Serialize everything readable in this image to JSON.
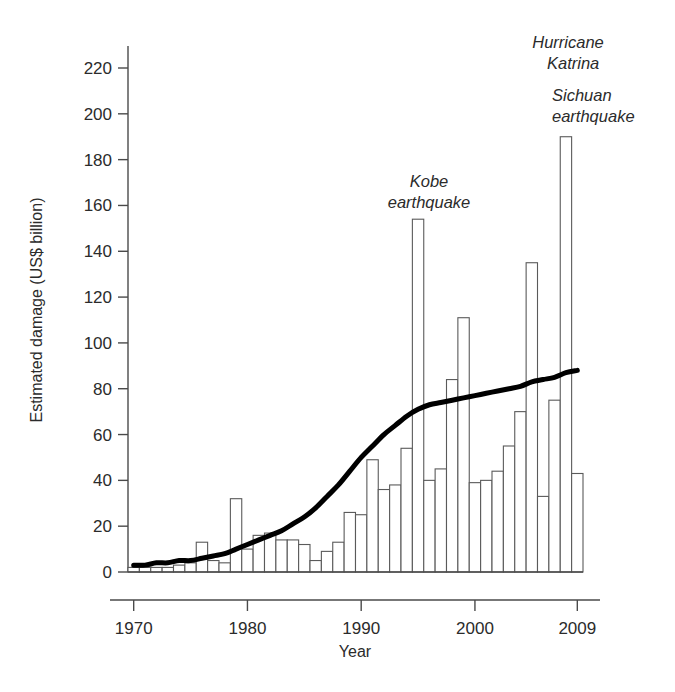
{
  "chart_data": {
    "type": "bar",
    "title": "",
    "xlabel": "Year",
    "ylabel": "Estimated damage (US$ billion)",
    "xlim": [
      1969.5,
      2009.5
    ],
    "ylim": [
      0,
      230
    ],
    "grid": false,
    "legend": "none",
    "x_tick_labels": [
      "1970",
      "1980",
      "1990",
      "2000",
      "2009"
    ],
    "x_tick_values": [
      1970,
      1980,
      1990,
      2000,
      2009
    ],
    "y_tick_labels": [
      "0",
      "20",
      "40",
      "60",
      "80",
      "100",
      "120",
      "140",
      "160",
      "180",
      "200",
      "220"
    ],
    "y_tick_values": [
      0,
      20,
      40,
      60,
      80,
      100,
      120,
      140,
      160,
      180,
      200,
      220
    ],
    "categories": [
      1970,
      1971,
      1972,
      1973,
      1974,
      1975,
      1976,
      1977,
      1978,
      1979,
      1980,
      1981,
      1982,
      1983,
      1984,
      1985,
      1986,
      1987,
      1988,
      1989,
      1990,
      1991,
      1992,
      1993,
      1994,
      1995,
      1996,
      1997,
      1998,
      1999,
      2000,
      2001,
      2002,
      2003,
      2004,
      2005,
      2006,
      2007,
      2008,
      2009
    ],
    "values": [
      2,
      2,
      2,
      2,
      3,
      4,
      13,
      5,
      4,
      32,
      10,
      16,
      17,
      14,
      14,
      12,
      5,
      9,
      13,
      26,
      25,
      49,
      36,
      38,
      54,
      154,
      40,
      45,
      84,
      111,
      39,
      40,
      44,
      55,
      70,
      135,
      33,
      75,
      190,
      43
    ],
    "series": [
      {
        "name": "Estimated damage",
        "type": "bar",
        "values": [
          2,
          2,
          2,
          2,
          3,
          4,
          13,
          5,
          4,
          32,
          10,
          16,
          17,
          14,
          14,
          12,
          5,
          9,
          13,
          26,
          25,
          49,
          36,
          38,
          54,
          154,
          40,
          45,
          84,
          111,
          39,
          40,
          44,
          55,
          70,
          135,
          33,
          75,
          190,
          43
        ]
      },
      {
        "name": "Trend",
        "type": "line",
        "values": [
          3,
          3,
          4,
          4,
          5,
          5,
          6,
          7,
          8,
          10,
          12,
          14,
          16,
          18,
          21,
          24,
          28,
          33,
          38,
          44,
          50,
          55,
          60,
          64,
          68,
          71,
          73,
          74,
          75,
          76,
          77,
          78,
          79,
          80,
          81,
          83,
          84,
          85,
          87,
          88
        ]
      }
    ],
    "annotations": [
      {
        "id": "kobe",
        "line1": "Kobe",
        "line2": "earthquake",
        "year": 1995,
        "value": 154
      },
      {
        "id": "katrina",
        "line1": "Hurricane",
        "line2": "Katrina",
        "year": 2005,
        "value": 215
      },
      {
        "id": "sichuan",
        "line1": "Sichuan",
        "line2": "earthquake",
        "year": 2008,
        "value": 190
      }
    ],
    "colors": {
      "bar_fill": "#ffffff",
      "bar_stroke": "#5a5a5a",
      "trend_line": "#000000",
      "axis": "#4a4a4a",
      "text": "#2b2b2b",
      "background": "#ffffff"
    }
  }
}
